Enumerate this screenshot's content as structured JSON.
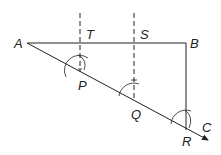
{
  "diagram": {
    "type": "geometric-construction",
    "points": {
      "A": {
        "label": "A",
        "x": 27,
        "y": 43
      },
      "B": {
        "label": "B",
        "x": 186,
        "y": 43
      },
      "T": {
        "label": "T",
        "x": 80,
        "y": 43
      },
      "S": {
        "label": "S",
        "x": 134,
        "y": 43
      },
      "P": {
        "label": "P",
        "x": 80,
        "y": 72
      },
      "Q": {
        "label": "Q",
        "x": 134,
        "y": 101
      },
      "R": {
        "label": "R",
        "x": 186,
        "y": 130
      },
      "C": {
        "label": "C",
        "x": 208,
        "y": 140
      }
    },
    "lines": [
      {
        "from": "A",
        "to": "B",
        "style": "solid"
      },
      {
        "from": "A",
        "to": "C",
        "style": "solid-arrow"
      },
      {
        "from": "B",
        "to": "R",
        "style": "solid"
      },
      {
        "from": "T",
        "to": "P",
        "style": "dashed"
      },
      {
        "from": "S",
        "to": "Q",
        "style": "dashed"
      }
    ],
    "colors": {
      "stroke": "#222222",
      "background": "#ffffff"
    }
  }
}
